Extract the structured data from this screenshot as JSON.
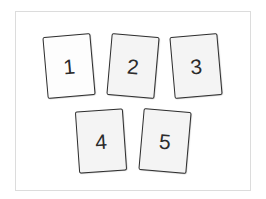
{
  "diagram": {
    "frame": {
      "border_color": "#dcdcdc",
      "background": "#ffffff"
    },
    "cards": [
      {
        "label": "1",
        "left": 45,
        "top": 35,
        "rotate": -5,
        "fill": "#fdfdfd"
      },
      {
        "label": "2",
        "left": 109,
        "top": 35,
        "rotate": 5,
        "fill": "#f4f4f4"
      },
      {
        "label": "3",
        "left": 172,
        "top": 35,
        "rotate": -5,
        "fill": "#f4f4f4"
      },
      {
        "label": "4",
        "left": 77,
        "top": 110,
        "rotate": -4,
        "fill": "#f4f4f4"
      },
      {
        "label": "5",
        "left": 141,
        "top": 110,
        "rotate": 5,
        "fill": "#f4f4f4"
      }
    ]
  }
}
